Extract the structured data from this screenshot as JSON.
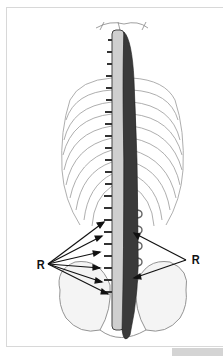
{
  "figure": {
    "labels": [
      {
        "id": "left",
        "text": "R"
      },
      {
        "id": "right",
        "text": "R"
      }
    ],
    "colors": {
      "muscle": "#3a3a3a",
      "bone_line": "#777777",
      "arrow": "#111111",
      "frame": "#d8d8d8",
      "footer_strip": "#d4d4d4"
    }
  }
}
